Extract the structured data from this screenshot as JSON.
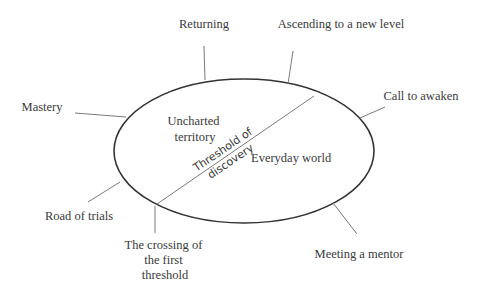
{
  "diagram": {
    "title": "",
    "ellipse": {
      "regions": {
        "upper_left": [
          "Uncharted",
          "territory"
        ],
        "lower_right": "Everyday world",
        "divider_label": [
          "Threshold of",
          "discovery"
        ]
      }
    },
    "stages": [
      {
        "id": "call-to-awaken",
        "label": "Call to awaken"
      },
      {
        "id": "meeting-a-mentor",
        "label": "Meeting a mentor"
      },
      {
        "id": "crossing-first-threshold",
        "label_lines": [
          "The crossing of",
          "the first",
          "threshold"
        ]
      },
      {
        "id": "road-of-trials",
        "label": "Road of trials"
      },
      {
        "id": "mastery",
        "label": "Mastery"
      },
      {
        "id": "returning",
        "label": "Returning"
      },
      {
        "id": "ascending",
        "label": "Ascending to a new level"
      }
    ],
    "colors": {
      "ellipse_stroke": "#333333",
      "leader_stroke": "#7a7a7a",
      "text": "#3a3a3a",
      "background": "#ffffff"
    }
  }
}
